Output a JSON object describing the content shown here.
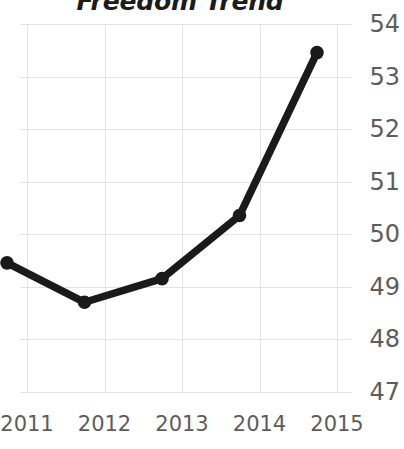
{
  "chart_data": {
    "type": "line",
    "title": "Freedom Trend",
    "xlabel": "",
    "ylabel": "",
    "categories": [
      "2011",
      "2012",
      "2013",
      "2014",
      "2015"
    ],
    "values": [
      49.0,
      48.25,
      48.7,
      49.9,
      53.0
    ],
    "series": [
      {
        "name": "Freedom Trend",
        "values": [
          49.0,
          48.25,
          48.7,
          49.9,
          53.0
        ]
      }
    ],
    "ylim": [
      47,
      54
    ],
    "yticks": [
      47,
      48,
      49,
      50,
      51,
      52,
      53,
      54
    ],
    "ytick_labels": [
      "47",
      "48",
      "49",
      "50",
      "51",
      "52",
      "53",
      "54"
    ],
    "xtick_labels": [
      "2011",
      "2012",
      "2013",
      "2014",
      "2015"
    ],
    "y_axis_position": "right",
    "grid": true,
    "legend": "none",
    "line_color": "#1a1a1a",
    "marker": "circle",
    "marker_color": "#1a1a1a",
    "grid_color": "#e3e3e3",
    "tick_label_color": "#5d5d5d",
    "title_color": "#1b1b1b",
    "background_color": "#ffffff"
  }
}
